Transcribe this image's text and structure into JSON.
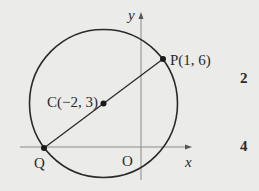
{
  "diagram": {
    "axes": {
      "x_label": "x",
      "y_label": "y",
      "origin_label": "O"
    },
    "points": {
      "P": {
        "label": "P(1, 6)",
        "x": 1,
        "y": 6
      },
      "C": {
        "label": "C(−2, 3)",
        "x": -2,
        "y": 3
      },
      "Q": {
        "label": "Q"
      }
    },
    "side_numbers": [
      "2",
      "4"
    ],
    "colors": {
      "background": "#ebebea",
      "stroke": "#2a2a2a",
      "axis": "#8a8a8a"
    }
  }
}
